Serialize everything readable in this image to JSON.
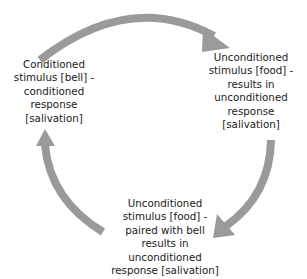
{
  "diagram": {
    "type": "cycle",
    "arrow_color": "#9a9a9a",
    "nodes": [
      {
        "id": "left",
        "text": "Conditioned stimulus [bell] - conditioned response [salivation]",
        "lines": [
          "Conditioned",
          "stimulus [bell] -",
          "conditioned",
          "response",
          "[salivation]"
        ]
      },
      {
        "id": "right",
        "text": "Unconditioned stimulus [food] - results in unconditioned response [salivation]",
        "lines": [
          "Unconditioned",
          "stimulus [food] -",
          "results in",
          "unconditioned",
          "response",
          "[salivation]"
        ]
      },
      {
        "id": "bottom",
        "text": "Unconditioned stimulus [food] - paired with bell results in unconditioned response [salivation]",
        "lines": [
          "Unconditioned",
          "stimulus [food] -",
          "paired with bell",
          "results in",
          "unconditioned",
          "response [salivation]"
        ]
      }
    ],
    "edges": [
      {
        "from": "left",
        "to": "right",
        "label": ""
      },
      {
        "from": "right",
        "to": "bottom",
        "label": ""
      },
      {
        "from": "bottom",
        "to": "left",
        "label": ""
      }
    ]
  }
}
